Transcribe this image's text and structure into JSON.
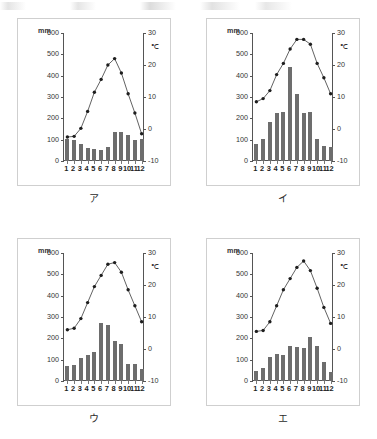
{
  "page": {
    "caption_font_note": "",
    "charts": [
      {
        "id": "chart-a",
        "caption": "ア",
        "left_unit": "mm",
        "right_unit": "℃",
        "left_ticks": [
          "600",
          "500",
          "400",
          "300",
          "200",
          "100",
          "0"
        ],
        "right_ticks": [
          "30",
          "20",
          "10",
          "0",
          "-10"
        ],
        "months": [
          "1",
          "2",
          "3",
          "4",
          "5",
          "6",
          "7",
          "8",
          "9",
          "10",
          "11",
          "12"
        ],
        "chart_data": {
          "type": "bar",
          "title": "ア",
          "categories": [
            "1",
            "2",
            "3",
            "4",
            "5",
            "6",
            "7",
            "8",
            "9",
            "10",
            "11",
            "12"
          ],
          "xlabel": "",
          "ylabel": "mm",
          "ylim": [
            0,
            600
          ],
          "y2label": "℃",
          "y2lim": [
            -10,
            30
          ],
          "grid": false,
          "legend": "none",
          "series": [
            {
              "name": "降水量",
              "type": "bar",
              "unit": "mm",
              "axis": "left",
              "values": [
                105,
                98,
                78,
                60,
                54,
                52,
                64,
                135,
                134,
                122,
                100,
                101
              ]
            },
            {
              "name": "気温",
              "type": "line",
              "unit": "℃",
              "axis": "right",
              "values": [
                -2.5,
                -2.3,
                0.2,
                5.5,
                11.5,
                15.5,
                20.0,
                22.0,
                17.5,
                11.0,
                5.0,
                -1.5
              ]
            }
          ]
        }
      },
      {
        "id": "chart-b",
        "caption": "イ",
        "left_unit": "mm",
        "right_unit": "℃",
        "left_ticks": [
          "600",
          "500",
          "400",
          "300",
          "200",
          "100",
          "0"
        ],
        "right_ticks": [
          "30",
          "20",
          "10",
          "0",
          "-10"
        ],
        "months": [
          "1",
          "2",
          "3",
          "4",
          "5",
          "6",
          "7",
          "8",
          "9",
          "10",
          "11",
          "12"
        ],
        "chart_data": {
          "type": "bar",
          "title": "イ",
          "categories": [
            "1",
            "2",
            "3",
            "4",
            "5",
            "6",
            "7",
            "8",
            "9",
            "10",
            "11",
            "12"
          ],
          "xlabel": "",
          "ylabel": "mm",
          "ylim": [
            0,
            600
          ],
          "y2label": "℃",
          "y2lim": [
            -10,
            30
          ],
          "grid": false,
          "legend": "none",
          "series": [
            {
              "name": "降水量",
              "type": "bar",
              "unit": "mm",
              "axis": "left",
              "values": [
                82,
                104,
                182,
                226,
                232,
                440,
                312,
                224,
                228,
                103,
                72,
                68
              ]
            },
            {
              "name": "気温",
              "type": "line",
              "unit": "℃",
              "axis": "right",
              "values": [
                8.5,
                9.5,
                12.0,
                17.0,
                20.5,
                25.0,
                28.0,
                28.0,
                26.5,
                20.5,
                16.0,
                11.0
              ]
            }
          ]
        }
      },
      {
        "id": "chart-c",
        "caption": "ウ",
        "left_unit": "mm",
        "right_unit": "℃",
        "left_ticks": [
          "600",
          "500",
          "400",
          "300",
          "200",
          "100",
          "0"
        ],
        "right_ticks": [
          "30",
          "20",
          "10",
          "0",
          "-10"
        ],
        "months": [
          "1",
          "2",
          "3",
          "4",
          "5",
          "6",
          "7",
          "8",
          "9",
          "10",
          "11",
          "12"
        ],
        "chart_data": {
          "type": "bar",
          "title": "ウ",
          "categories": [
            "1",
            "2",
            "3",
            "4",
            "5",
            "6",
            "7",
            "8",
            "9",
            "10",
            "11",
            "12"
          ],
          "xlabel": "",
          "ylabel": "mm",
          "ylim": [
            0,
            600
          ],
          "y2label": "℃",
          "y2lim": [
            -10,
            30
          ],
          "grid": false,
          "legend": "none",
          "series": [
            {
              "name": "降水量",
              "type": "bar",
              "unit": "mm",
              "axis": "left",
              "values": [
                72,
                73,
                110,
                122,
                137,
                270,
                263,
                186,
                174,
                80,
                80,
                54
              ]
            },
            {
              "name": "気温",
              "type": "line",
              "unit": "℃",
              "axis": "right",
              "values": [
                6.0,
                6.5,
                9.5,
                14.5,
                19.5,
                23.0,
                26.5,
                27.0,
                24.0,
                18.5,
                13.5,
                8.5
              ]
            }
          ]
        }
      },
      {
        "id": "chart-d",
        "caption": "エ",
        "left_unit": "mm",
        "right_unit": "℃",
        "left_ticks": [
          "600",
          "500",
          "400",
          "300",
          "200",
          "100",
          "0"
        ],
        "right_ticks": [
          "30",
          "20",
          "10",
          "0",
          "-10"
        ],
        "months": [
          "1",
          "2",
          "3",
          "4",
          "5",
          "6",
          "7",
          "8",
          "9",
          "10",
          "11",
          "12"
        ],
        "chart_data": {
          "type": "bar",
          "title": "エ",
          "categories": [
            "1",
            "2",
            "3",
            "4",
            "5",
            "6",
            "7",
            "8",
            "9",
            "10",
            "11",
            "12"
          ],
          "xlabel": "",
          "ylabel": "mm",
          "ylim": [
            0,
            600
          ],
          "y2label": "℃",
          "y2lim": [
            -10,
            30
          ],
          "grid": false,
          "legend": "none",
          "series": [
            {
              "name": "降水量",
              "type": "bar",
              "unit": "mm",
              "axis": "left",
              "values": [
                48,
                60,
                113,
                126,
                124,
                162,
                160,
                155,
                206,
                162,
                90,
                40
              ]
            },
            {
              "name": "気温",
              "type": "line",
              "unit": "℃",
              "axis": "right",
              "values": [
                5.5,
                5.8,
                8.5,
                13.5,
                18.5,
                22.0,
                25.5,
                27.5,
                24.5,
                19.0,
                13.0,
                8.0
              ]
            }
          ]
        }
      }
    ]
  }
}
